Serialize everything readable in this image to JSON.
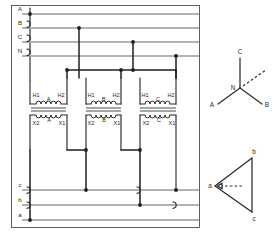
{
  "diagram": {
    "type": "three-phase-transformer-bank",
    "primary_connection": "wye",
    "secondary_connection": "delta",
    "accent_color": "#2b2b2b",
    "background_color": "#ffffff"
  },
  "primary_bus": {
    "labels": [
      "A",
      "B",
      "C",
      "N"
    ],
    "lines": [
      {
        "label": "A",
        "y": 14
      },
      {
        "label": "B",
        "y": 28
      },
      {
        "label": "C",
        "y": 42
      },
      {
        "label": "N",
        "y": 56
      }
    ]
  },
  "secondary_bus": {
    "labels": [
      "c",
      "b",
      "a"
    ],
    "lines": [
      {
        "label": "c",
        "y": 190
      },
      {
        "label": "b",
        "y": 205
      },
      {
        "label": "a",
        "y": 220
      }
    ]
  },
  "transformers": [
    {
      "name": "A",
      "phase_label": "A",
      "primary": {
        "left_terminal": "H1",
        "right_terminal": "H2"
      },
      "secondary": {
        "left_terminal": "X2",
        "right_terminal": "X1"
      }
    },
    {
      "name": "B",
      "phase_label": "B",
      "primary": {
        "left_terminal": "H1",
        "right_terminal": "H2"
      },
      "secondary": {
        "left_terminal": "X2",
        "right_terminal": "X1"
      }
    },
    {
      "name": "C",
      "phase_label": "C",
      "primary": {
        "left_terminal": "H1",
        "right_terminal": "H2"
      },
      "secondary": {
        "left_terminal": "X2",
        "right_terminal": "X1"
      }
    }
  ],
  "vector_diagrams": [
    {
      "id": "wye",
      "shape": "wye",
      "center_label": "N",
      "vertices": [
        {
          "label": "C",
          "position": "top"
        },
        {
          "label": "A",
          "position": "bottom-left"
        },
        {
          "label": "B",
          "position": "bottom-right"
        }
      ],
      "has_dashed_reference": true
    },
    {
      "id": "delta",
      "shape": "delta",
      "vertices": [
        {
          "label": "b",
          "position": "top-right"
        },
        {
          "label": "a",
          "position": "left"
        },
        {
          "label": "c",
          "position": "bottom-right"
        }
      ],
      "has_dashed_reference": true
    }
  ]
}
